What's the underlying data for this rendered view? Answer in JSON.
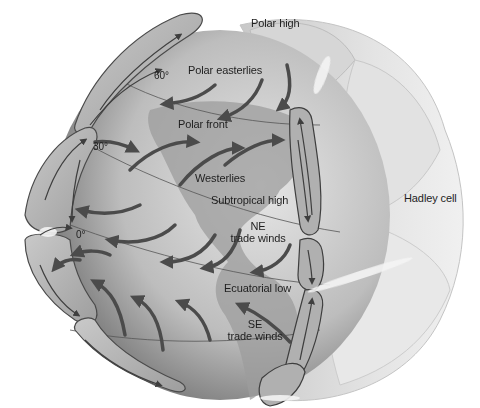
{
  "diagram": {
    "colors": {
      "background": "#ffffff",
      "globe_light": "#d9d9d9",
      "globe_dark": "#6e6e6e",
      "land": "#9a9a9a",
      "cell_fill": "#b9b9b9",
      "cell_outline": "#4a4a4a",
      "arrow": "#4b4b4b",
      "outer_shell": "#dcdcdc",
      "text": "#1e1e1e"
    },
    "labels": {
      "polar_high": "Polar high",
      "polar_easterlies": "Polar easterlies",
      "polar_front": "Polar front",
      "westerlies": "Westerlies",
      "subtropical_high": "Subtropical high",
      "ne_trade_winds_line1": "NE",
      "ne_trade_winds_line2": "trade winds",
      "equatorial_low": "Ecuatorial low",
      "se_trade_winds_line1": "SE",
      "se_trade_winds_line2": "trade winds",
      "hadley_cell": "Hadley cell"
    },
    "latitudes": {
      "lat60": "60°",
      "lat30": "30°",
      "lat0": "0°"
    }
  }
}
